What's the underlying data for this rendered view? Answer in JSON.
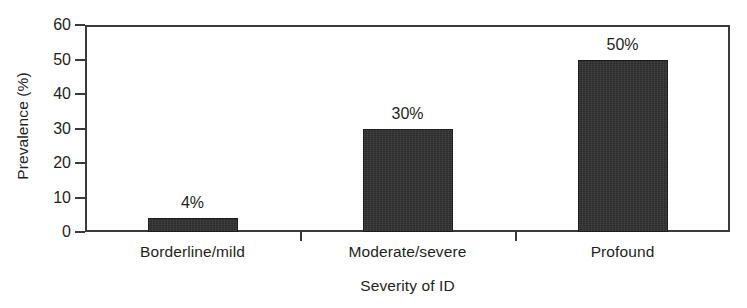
{
  "chart_data": {
    "type": "bar",
    "title": "",
    "xlabel": "Severity of ID",
    "ylabel": "Prevalence (%)",
    "categories": [
      "Borderline/mild",
      "Moderate/severe",
      "Profound"
    ],
    "values": [
      4,
      30,
      50
    ],
    "data_labels": [
      "4%",
      "30%",
      "50%"
    ],
    "ylim": [
      0,
      60
    ],
    "yticks": [
      0,
      10,
      20,
      30,
      40,
      50,
      60
    ],
    "ytick_labels": [
      "0",
      "10",
      "20",
      "30",
      "40",
      "50",
      "60"
    ],
    "grid": false,
    "legend": null,
    "bar_color": "#2c2c2c",
    "axis_color": "#3a3a3a",
    "background_color": "#ffffff"
  }
}
